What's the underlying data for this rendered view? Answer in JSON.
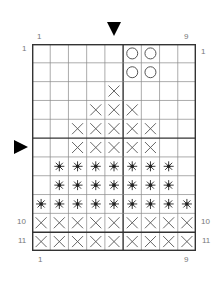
{
  "chart": {
    "columns": 9,
    "rows": 11,
    "column_labels_top": {
      "first": "1",
      "last": "9"
    },
    "column_labels_bottom": {
      "first": "1",
      "last": "9"
    },
    "row_labels_left": {
      "first": "1",
      "r10": "10",
      "r11": "11"
    },
    "row_labels_right": {
      "first": "1",
      "r10": "10",
      "r11": "11"
    },
    "markers": {
      "top_arrow": {
        "icon": "triangle-down-icon",
        "column": 5
      },
      "side_arrow": {
        "icon": "triangle-right-icon",
        "row": 6
      }
    },
    "thick_lines": {
      "vertical_after_column": 5,
      "horizontal_after_rows": [
        5,
        10
      ]
    },
    "symbols": {
      "O": "circle-stitch-icon",
      "X": "cross-stitch-icon",
      "*": "star-stitch-icon",
      ".": "empty"
    },
    "pattern": [
      ".....OO..",
      ".....OO..",
      "....X....",
      "...XXX...",
      "..XXXXX..",
      "..XXXXX..",
      ".*******.",
      ".*******.",
      "*********",
      "XXXXXXXXX",
      "XXXXXXXXX"
    ],
    "colors": {
      "grid": "#888888",
      "thick": "#333333",
      "symbol": "#555555",
      "star": "#222222",
      "label": "#777777"
    }
  }
}
